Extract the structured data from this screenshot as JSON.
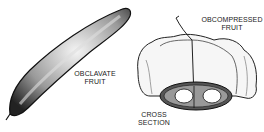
{
  "labels": {
    "obclavate": [
      "OBCLAVATE",
      "FRUIT"
    ],
    "obcompressed": [
      "OBCOMPRESSED",
      "FRUIT"
    ],
    "cross_section": [
      "CROSS",
      "SECTION"
    ]
  }
}
